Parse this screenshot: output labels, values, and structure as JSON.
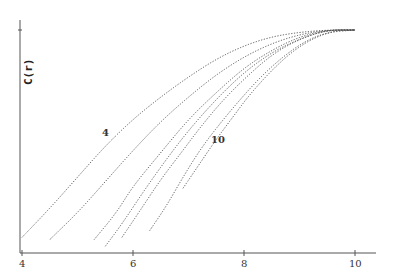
{
  "chart_data": {
    "type": "line",
    "title": "",
    "xlabel": "",
    "ylabel": "C(r)",
    "xlim": [
      4,
      10.4
    ],
    "ylim": [
      0,
      1
    ],
    "x_ticks": [
      "4",
      "6",
      "8",
      "10"
    ],
    "grid": false,
    "legend": "none",
    "annotations": [
      {
        "text": "4",
        "x": 5.4,
        "y": 0.51
      },
      {
        "text": "10",
        "x": 7.5,
        "y": 0.48
      }
    ],
    "series": [
      {
        "name": "4",
        "x": [
          4.0,
          4.5,
          5.0,
          5.5,
          6.0,
          6.5,
          7.0,
          7.5,
          8.0,
          8.5,
          9.0,
          9.5,
          10.0
        ],
        "values": [
          0.07,
          0.2,
          0.34,
          0.48,
          0.6,
          0.7,
          0.79,
          0.87,
          0.93,
          0.97,
          0.99,
          1.0,
          1.0
        ]
      },
      {
        "name": "5",
        "x": [
          4.5,
          5.0,
          5.5,
          6.0,
          6.5,
          7.0,
          7.5,
          8.0,
          8.5,
          9.0,
          9.5,
          10.0
        ],
        "values": [
          0.06,
          0.18,
          0.32,
          0.46,
          0.59,
          0.7,
          0.8,
          0.88,
          0.94,
          0.98,
          1.0,
          1.0
        ]
      },
      {
        "name": "6",
        "x": [
          5.3,
          5.7,
          6.0,
          6.5,
          7.0,
          7.5,
          8.0,
          8.5,
          9.0,
          9.5,
          10.0
        ],
        "values": [
          0.06,
          0.18,
          0.3,
          0.45,
          0.6,
          0.72,
          0.83,
          0.91,
          0.97,
          1.0,
          1.0
        ]
      },
      {
        "name": "7",
        "x": [
          5.5,
          5.8,
          6.2,
          6.6,
          7.0,
          7.5,
          8.0,
          8.5,
          9.0,
          9.5,
          10.0
        ],
        "values": [
          0.03,
          0.13,
          0.28,
          0.42,
          0.55,
          0.69,
          0.81,
          0.9,
          0.96,
          1.0,
          1.0
        ]
      },
      {
        "name": "8",
        "x": [
          5.8,
          6.1,
          6.5,
          6.9,
          7.2,
          7.6,
          8.0,
          8.5,
          9.0,
          9.5,
          10.0
        ],
        "values": [
          0.07,
          0.18,
          0.33,
          0.46,
          0.56,
          0.68,
          0.78,
          0.89,
          0.96,
          1.0,
          1.0
        ]
      },
      {
        "name": "9",
        "x": [
          6.3,
          6.6,
          6.9,
          7.2,
          7.5,
          7.9,
          8.3,
          8.7,
          9.1,
          9.5,
          10.0
        ],
        "values": [
          0.1,
          0.21,
          0.34,
          0.46,
          0.56,
          0.68,
          0.79,
          0.88,
          0.95,
          0.99,
          1.0
        ]
      },
      {
        "name": "10",
        "x": [
          6.9,
          7.2,
          7.5,
          7.8,
          8.1,
          8.5,
          8.9,
          9.3,
          9.7,
          10.0
        ],
        "values": [
          0.29,
          0.4,
          0.51,
          0.61,
          0.71,
          0.82,
          0.91,
          0.97,
          1.0,
          1.0
        ]
      }
    ]
  },
  "axes": {
    "ylabel": "C(r)",
    "xticks": [
      {
        "label": "4",
        "value": 4
      },
      {
        "label": "6",
        "value": 6
      },
      {
        "label": "8",
        "value": 8
      },
      {
        "label": "10",
        "value": 10
      }
    ]
  },
  "annotations": {
    "first_curve": "4",
    "last_curve": "10"
  }
}
